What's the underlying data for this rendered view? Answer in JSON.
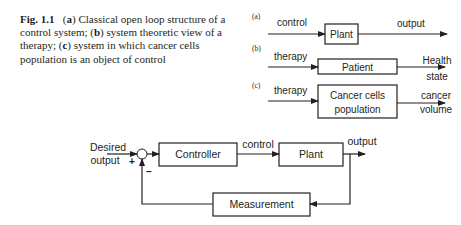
{
  "caption": {
    "figure_label": "Fig. 1.1",
    "part_a_tag": "a",
    "part_a_text": "Classical open loop structure of a control system;",
    "part_b_tag": "b",
    "part_b_text": "system theoretic view of a therapy;",
    "part_c_tag": "c",
    "part_c_text": "system in which cancer cells population is an object of control"
  },
  "diagram_a": {
    "tag": "(a)",
    "input_label": "control",
    "block_label": "Plant",
    "output_label": "output"
  },
  "diagram_b": {
    "tag": "(b)",
    "input_label": "therapy",
    "block_label": "Patient",
    "output_label_line1": "Health",
    "output_label_line2": "state"
  },
  "diagram_c": {
    "tag": "(c)",
    "input_label": "therapy",
    "block_label_line1": "Cancer cells",
    "block_label_line2": "population",
    "output_label_line1": "cancer",
    "output_label_line2": "volume"
  },
  "feedback_loop": {
    "reference_label_line1": "Desired",
    "reference_label_line2": "output",
    "plus_sign": "+",
    "minus_sign": "−",
    "controller_label": "Controller",
    "control_label": "control",
    "plant_label": "Plant",
    "output_label": "output",
    "measurement_label": "Measurement"
  }
}
